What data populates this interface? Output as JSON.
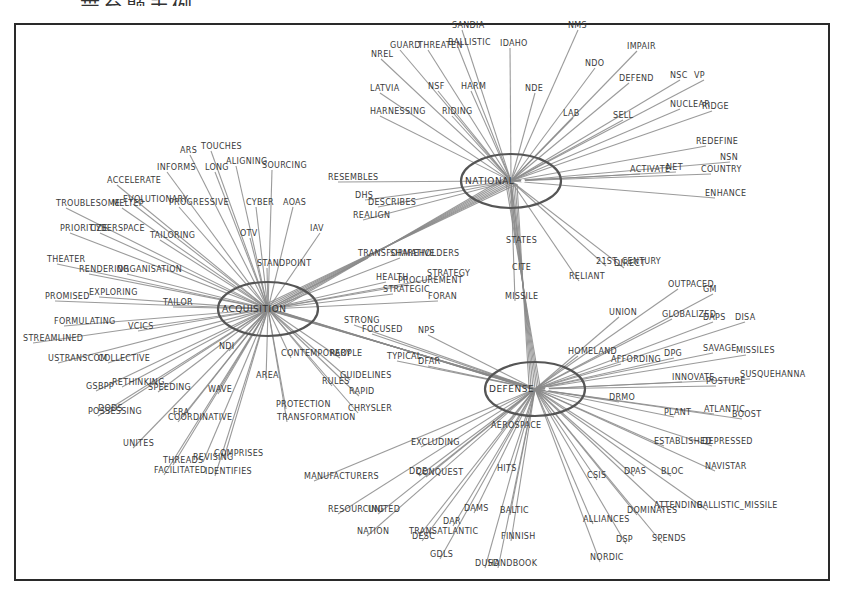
{
  "caption_fragment": "带至题手例。",
  "diagram": {
    "type": "star-network",
    "hubs": [
      {
        "id": "national",
        "label": "NATIONAL",
        "cx": 511,
        "cy": 181,
        "rx": 50,
        "ry": 27
      },
      {
        "id": "acquisition",
        "label": "ACQUISITION",
        "cx": 268,
        "cy": 309,
        "rx": 50,
        "ry": 27
      },
      {
        "id": "defense",
        "label": "DEFENSE",
        "cx": 535,
        "cy": 389,
        "rx": 50,
        "ry": 27
      }
    ],
    "nodes": [
      {
        "label": "SANDIA",
        "x": 452,
        "y": 28,
        "hub": "national"
      },
      {
        "label": "NMS",
        "x": 568,
        "y": 28,
        "hub": "national"
      },
      {
        "label": "GUARD",
        "x": 390,
        "y": 48,
        "hub": "national"
      },
      {
        "label": "THREATEN",
        "x": 418,
        "y": 48,
        "hub": "national"
      },
      {
        "label": "BALLISTIC",
        "x": 448,
        "y": 45,
        "hub": "national"
      },
      {
        "label": "IDAHO",
        "x": 500,
        "y": 46,
        "hub": "national"
      },
      {
        "label": "NREL",
        "x": 371,
        "y": 57,
        "hub": "national"
      },
      {
        "label": "IMPAIR",
        "x": 627,
        "y": 49,
        "hub": "national"
      },
      {
        "label": "NDO",
        "x": 585,
        "y": 66,
        "hub": "national"
      },
      {
        "label": "DEFEND",
        "x": 619,
        "y": 81,
        "hub": "national"
      },
      {
        "label": "NSC",
        "x": 670,
        "y": 78,
        "hub": "national"
      },
      {
        "label": "VP",
        "x": 694,
        "y": 78,
        "hub": "national"
      },
      {
        "label": "LATVIA",
        "x": 370,
        "y": 91,
        "hub": "national"
      },
      {
        "label": "NSF",
        "x": 428,
        "y": 89,
        "hub": "national"
      },
      {
        "label": "HARM",
        "x": 461,
        "y": 89,
        "hub": "national"
      },
      {
        "label": "NDE",
        "x": 525,
        "y": 91,
        "hub": "national"
      },
      {
        "label": "NUCLEAR",
        "x": 670,
        "y": 107,
        "hub": "national"
      },
      {
        "label": "RIDGE",
        "x": 702,
        "y": 109,
        "hub": "national"
      },
      {
        "label": "HARNESSING",
        "x": 370,
        "y": 114,
        "hub": "national"
      },
      {
        "label": "RIDING",
        "x": 442,
        "y": 114,
        "hub": "national"
      },
      {
        "label": "LAB",
        "x": 563,
        "y": 116,
        "hub": "national"
      },
      {
        "label": "SELL",
        "x": 613,
        "y": 118,
        "hub": "national"
      },
      {
        "label": "REDEFINE",
        "x": 696,
        "y": 144,
        "hub": "national"
      },
      {
        "label": "NSN",
        "x": 720,
        "y": 160,
        "hub": "national"
      },
      {
        "label": "ACTIVATE",
        "x": 630,
        "y": 172,
        "hub": "national"
      },
      {
        "label": "NET",
        "x": 666,
        "y": 170,
        "hub": "national"
      },
      {
        "label": "COUNTRY",
        "x": 701,
        "y": 172,
        "hub": "national"
      },
      {
        "label": "ENHANCE",
        "x": 705,
        "y": 196,
        "hub": "national"
      },
      {
        "label": "RESEMBLES",
        "x": 328,
        "y": 180,
        "hub": "national"
      },
      {
        "label": "DHS",
        "x": 355,
        "y": 198,
        "hub": "national"
      },
      {
        "label": "DESCRIBES",
        "x": 368,
        "y": 205,
        "hub": "national"
      },
      {
        "label": "REALIGN",
        "x": 353,
        "y": 218,
        "hub": "national"
      },
      {
        "label": "STATES",
        "x": 506,
        "y": 243,
        "hub": "national"
      },
      {
        "label": "CITE",
        "x": 512,
        "y": 270,
        "hub": "national"
      },
      {
        "label": "MISSILE",
        "x": 505,
        "y": 299,
        "hub": "national"
      },
      {
        "label": "RELIANT",
        "x": 569,
        "y": 279,
        "hub": "national"
      },
      {
        "label": "21ST_CENTURY",
        "x": 596,
        "y": 264,
        "hub": "national"
      },
      {
        "label": "DIRECT",
        "x": 614,
        "y": 266,
        "hub": "national"
      },
      {
        "label": "ARS",
        "x": 180,
        "y": 153,
        "hub": "acquisition"
      },
      {
        "label": "TOUCHES",
        "x": 201,
        "y": 149,
        "hub": "acquisition"
      },
      {
        "label": "INFORMS",
        "x": 157,
        "y": 170,
        "hub": "acquisition"
      },
      {
        "label": "LONG",
        "x": 205,
        "y": 170,
        "hub": "acquisition"
      },
      {
        "label": "ALIGNING",
        "x": 226,
        "y": 164,
        "hub": "acquisition"
      },
      {
        "label": "SOURCING",
        "x": 262,
        "y": 168,
        "hub": "acquisition"
      },
      {
        "label": "ACCELERATE",
        "x": 107,
        "y": 183,
        "hub": "acquisition"
      },
      {
        "label": "EVOLUTIONARY",
        "x": 123,
        "y": 202,
        "hub": "acquisition"
      },
      {
        "label": "TROUBLESOME",
        "x": 56,
        "y": 206,
        "hub": "acquisition"
      },
      {
        "label": "MELTEP",
        "x": 112,
        "y": 206,
        "hub": "acquisition"
      },
      {
        "label": "PROGRESSIVE",
        "x": 169,
        "y": 205,
        "hub": "acquisition"
      },
      {
        "label": "CYBER",
        "x": 246,
        "y": 205,
        "hub": "acquisition"
      },
      {
        "label": "AOAS",
        "x": 283,
        "y": 205,
        "hub": "acquisition"
      },
      {
        "label": "RESEMBLES2",
        "x": 0,
        "y": 0,
        "hub": "none"
      },
      {
        "label": "PRIORITIZE",
        "x": 60,
        "y": 231,
        "hub": "acquisition"
      },
      {
        "label": "CYBERSPACE",
        "x": 90,
        "y": 231,
        "hub": "acquisition"
      },
      {
        "label": "TAILORING",
        "x": 150,
        "y": 238,
        "hub": "acquisition"
      },
      {
        "label": "OTV",
        "x": 240,
        "y": 236,
        "hub": "acquisition"
      },
      {
        "label": "IAV",
        "x": 310,
        "y": 231,
        "hub": "acquisition"
      },
      {
        "label": "THEATER",
        "x": 47,
        "y": 262,
        "hub": "acquisition"
      },
      {
        "label": "RENDERING",
        "x": 79,
        "y": 272,
        "hub": "acquisition"
      },
      {
        "label": "ORGANISATION",
        "x": 117,
        "y": 272,
        "hub": "acquisition"
      },
      {
        "label": "STANDPOINT",
        "x": 257,
        "y": 266,
        "hub": "acquisition"
      },
      {
        "label": "PROMISED",
        "x": 45,
        "y": 299,
        "hub": "acquisition"
      },
      {
        "label": "EXPLORING",
        "x": 89,
        "y": 295,
        "hub": "acquisition"
      },
      {
        "label": "TAILOR",
        "x": 163,
        "y": 305,
        "hub": "acquisition"
      },
      {
        "label": "FORMULATING",
        "x": 54,
        "y": 324,
        "hub": "acquisition"
      },
      {
        "label": "VCICS",
        "x": 128,
        "y": 329,
        "hub": "acquisition"
      },
      {
        "label": "STREAMLINED",
        "x": 23,
        "y": 341,
        "hub": "acquisition"
      },
      {
        "label": "NDI",
        "x": 219,
        "y": 349,
        "hub": "acquisition"
      },
      {
        "label": "USTRANSCOM",
        "x": 48,
        "y": 361,
        "hub": "acquisition"
      },
      {
        "label": "COLLECTIVE",
        "x": 98,
        "y": 361,
        "hub": "acquisition"
      },
      {
        "label": "CONTEMPORARY",
        "x": 281,
        "y": 356,
        "hub": "acquisition"
      },
      {
        "label": "PEOPLE",
        "x": 330,
        "y": 356,
        "hub": "acquisition"
      },
      {
        "label": "AREA",
        "x": 256,
        "y": 378,
        "hub": "acquisition"
      },
      {
        "label": "GSBPP",
        "x": 86,
        "y": 389,
        "hub": "acquisition"
      },
      {
        "label": "RETHINKING",
        "x": 112,
        "y": 385,
        "hub": "acquisition"
      },
      {
        "label": "SPEEDING",
        "x": 148,
        "y": 390,
        "hub": "acquisition"
      },
      {
        "label": "WAVE",
        "x": 208,
        "y": 392,
        "hub": "acquisition"
      },
      {
        "label": "RULES",
        "x": 322,
        "y": 384,
        "hub": "acquisition"
      },
      {
        "label": "GUIDELINES",
        "x": 340,
        "y": 378,
        "hub": "acquisition"
      },
      {
        "label": "RAPID",
        "x": 349,
        "y": 394,
        "hub": "acquisition"
      },
      {
        "label": "POSSESSING",
        "x": 88,
        "y": 414,
        "hub": "acquisition"
      },
      {
        "label": "DODS",
        "x": 98,
        "y": 411,
        "hub": "acquisition"
      },
      {
        "label": "FRA",
        "x": 173,
        "y": 415,
        "hub": "acquisition"
      },
      {
        "label": "COORDINATIVE",
        "x": 168,
        "y": 420,
        "hub": "acquisition"
      },
      {
        "label": "PROTECTION",
        "x": 276,
        "y": 407,
        "hub": "acquisition"
      },
      {
        "label": "TRANSFORMATION",
        "x": 277,
        "y": 420,
        "hub": "acquisition"
      },
      {
        "label": "CHRYSLER",
        "x": 348,
        "y": 411,
        "hub": "acquisition"
      },
      {
        "label": "UNITES",
        "x": 123,
        "y": 446,
        "hub": "acquisition"
      },
      {
        "label": "COMPRISES",
        "x": 214,
        "y": 456,
        "hub": "acquisition"
      },
      {
        "label": "REVISING",
        "x": 193,
        "y": 460,
        "hub": "acquisition"
      },
      {
        "label": "THREADS",
        "x": 163,
        "y": 463,
        "hub": "acquisition"
      },
      {
        "label": "FACILITATED",
        "x": 154,
        "y": 473,
        "hub": "acquisition"
      },
      {
        "label": "IDENTIFIES",
        "x": 205,
        "y": 474,
        "hub": "acquisition"
      },
      {
        "label": "TRANSFORMATIVE",
        "x": 358,
        "y": 256,
        "hub": "acquisition"
      },
      {
        "label": "SHAREHOLDERS",
        "x": 390,
        "y": 256,
        "hub": "acquisition"
      },
      {
        "label": "HEALTH",
        "x": 376,
        "y": 280,
        "hub": "acquisition"
      },
      {
        "label": "STRATEGY",
        "x": 427,
        "y": 276,
        "hub": "acquisition"
      },
      {
        "label": "PROCUREMENT",
        "x": 398,
        "y": 283,
        "hub": "acquisition"
      },
      {
        "label": "STRATEGIC",
        "x": 383,
        "y": 292,
        "hub": "acquisition"
      },
      {
        "label": "FORAN",
        "x": 428,
        "y": 299,
        "hub": "acquisition"
      },
      {
        "label": "STRONG",
        "x": 344,
        "y": 323,
        "hub": "defense"
      },
      {
        "label": "FOCUSED",
        "x": 362,
        "y": 332,
        "hub": "defense"
      },
      {
        "label": "NPS",
        "x": 418,
        "y": 333,
        "hub": "defense"
      },
      {
        "label": "TYPICAL",
        "x": 387,
        "y": 359,
        "hub": "defense"
      },
      {
        "label": "DFAR",
        "x": 418,
        "y": 364,
        "hub": "defense"
      },
      {
        "label": "UNION",
        "x": 609,
        "y": 315,
        "hub": "defense"
      },
      {
        "label": "OUTPACED",
        "x": 668,
        "y": 287,
        "hub": "defense"
      },
      {
        "label": "GM",
        "x": 703,
        "y": 292,
        "hub": "defense"
      },
      {
        "label": "GLOBALIZED",
        "x": 662,
        "y": 317,
        "hub": "defense"
      },
      {
        "label": "DAPS",
        "x": 703,
        "y": 320,
        "hub": "defense"
      },
      {
        "label": "DISA",
        "x": 735,
        "y": 320,
        "hub": "defense"
      },
      {
        "label": "HOMELAND",
        "x": 568,
        "y": 354,
        "hub": "defense"
      },
      {
        "label": "AFFORDING",
        "x": 611,
        "y": 362,
        "hub": "defense"
      },
      {
        "label": "DPG",
        "x": 664,
        "y": 356,
        "hub": "defense"
      },
      {
        "label": "SAVAGE",
        "x": 703,
        "y": 351,
        "hub": "defense"
      },
      {
        "label": "MISSILES",
        "x": 736,
        "y": 353,
        "hub": "defense"
      },
      {
        "label": "INNOVATE",
        "x": 672,
        "y": 380,
        "hub": "defense"
      },
      {
        "label": "POSTURE",
        "x": 706,
        "y": 384,
        "hub": "defense"
      },
      {
        "label": "SUSQUEHANNA",
        "x": 740,
        "y": 377,
        "hub": "defense"
      },
      {
        "label": "DRMO",
        "x": 609,
        "y": 400,
        "hub": "defense"
      },
      {
        "label": "PLANT",
        "x": 664,
        "y": 415,
        "hub": "defense"
      },
      {
        "label": "ATLANTIC",
        "x": 704,
        "y": 412,
        "hub": "defense"
      },
      {
        "label": "BOOST",
        "x": 732,
        "y": 417,
        "hub": "defense"
      },
      {
        "label": "ESTABLISHED",
        "x": 654,
        "y": 444,
        "hub": "defense"
      },
      {
        "label": "DEPRESSED",
        "x": 702,
        "y": 444,
        "hub": "defense"
      },
      {
        "label": "NAVISTAR",
        "x": 705,
        "y": 469,
        "hub": "defense"
      },
      {
        "label": "CSIS",
        "x": 587,
        "y": 478,
        "hub": "defense"
      },
      {
        "label": "DPAS",
        "x": 624,
        "y": 474,
        "hub": "defense"
      },
      {
        "label": "BLOC",
        "x": 661,
        "y": 474,
        "hub": "defense"
      },
      {
        "label": "ATTENDING",
        "x": 654,
        "y": 508,
        "hub": "defense"
      },
      {
        "label": "BALLISTIC_MISSILE",
        "x": 697,
        "y": 508,
        "hub": "defense"
      },
      {
        "label": "DOMINATES",
        "x": 627,
        "y": 513,
        "hub": "defense"
      },
      {
        "label": "ALLIANCES",
        "x": 583,
        "y": 522,
        "hub": "defense"
      },
      {
        "label": "DSP",
        "x": 616,
        "y": 542,
        "hub": "defense"
      },
      {
        "label": "SPENDS",
        "x": 652,
        "y": 541,
        "hub": "defense"
      },
      {
        "label": "NORDIC",
        "x": 590,
        "y": 560,
        "hub": "defense"
      },
      {
        "label": "AEROSPACE",
        "x": 491,
        "y": 428,
        "hub": "defense"
      },
      {
        "label": "EXCLUDING",
        "x": 411,
        "y": 445,
        "hub": "defense"
      },
      {
        "label": "MANUFACTURERS",
        "x": 304,
        "y": 479,
        "hub": "defense"
      },
      {
        "label": "DDE",
        "x": 409,
        "y": 474,
        "hub": "defense"
      },
      {
        "label": "CONQUEST",
        "x": 416,
        "y": 475,
        "hub": "defense"
      },
      {
        "label": "HITS",
        "x": 497,
        "y": 471,
        "hub": "defense"
      },
      {
        "label": "RESOURCING",
        "x": 328,
        "y": 512,
        "hub": "defense"
      },
      {
        "label": "UNITED",
        "x": 368,
        "y": 512,
        "hub": "defense"
      },
      {
        "label": "DAMS",
        "x": 464,
        "y": 511,
        "hub": "defense"
      },
      {
        "label": "BALTIC",
        "x": 500,
        "y": 513,
        "hub": "defense"
      },
      {
        "label": "DAR",
        "x": 443,
        "y": 524,
        "hub": "defense"
      },
      {
        "label": "NATION",
        "x": 357,
        "y": 534,
        "hub": "defense"
      },
      {
        "label": "TRANSATLANTIC",
        "x": 409,
        "y": 534,
        "hub": "defense"
      },
      {
        "label": "DESC",
        "x": 412,
        "y": 539,
        "hub": "defense"
      },
      {
        "label": "FINNISH",
        "x": 501,
        "y": 539,
        "hub": "defense"
      },
      {
        "label": "GDLS",
        "x": 430,
        "y": 557,
        "hub": "defense"
      },
      {
        "label": "DUSD",
        "x": 475,
        "y": 566,
        "hub": "defense"
      },
      {
        "label": "HANDBOOK",
        "x": 488,
        "y": 566,
        "hub": "defense"
      }
    ]
  },
  "colors": {
    "edge": "#8a8a8a",
    "ring": "#555555",
    "text": "#3a3a3a",
    "frame": "#2a2a2a"
  }
}
